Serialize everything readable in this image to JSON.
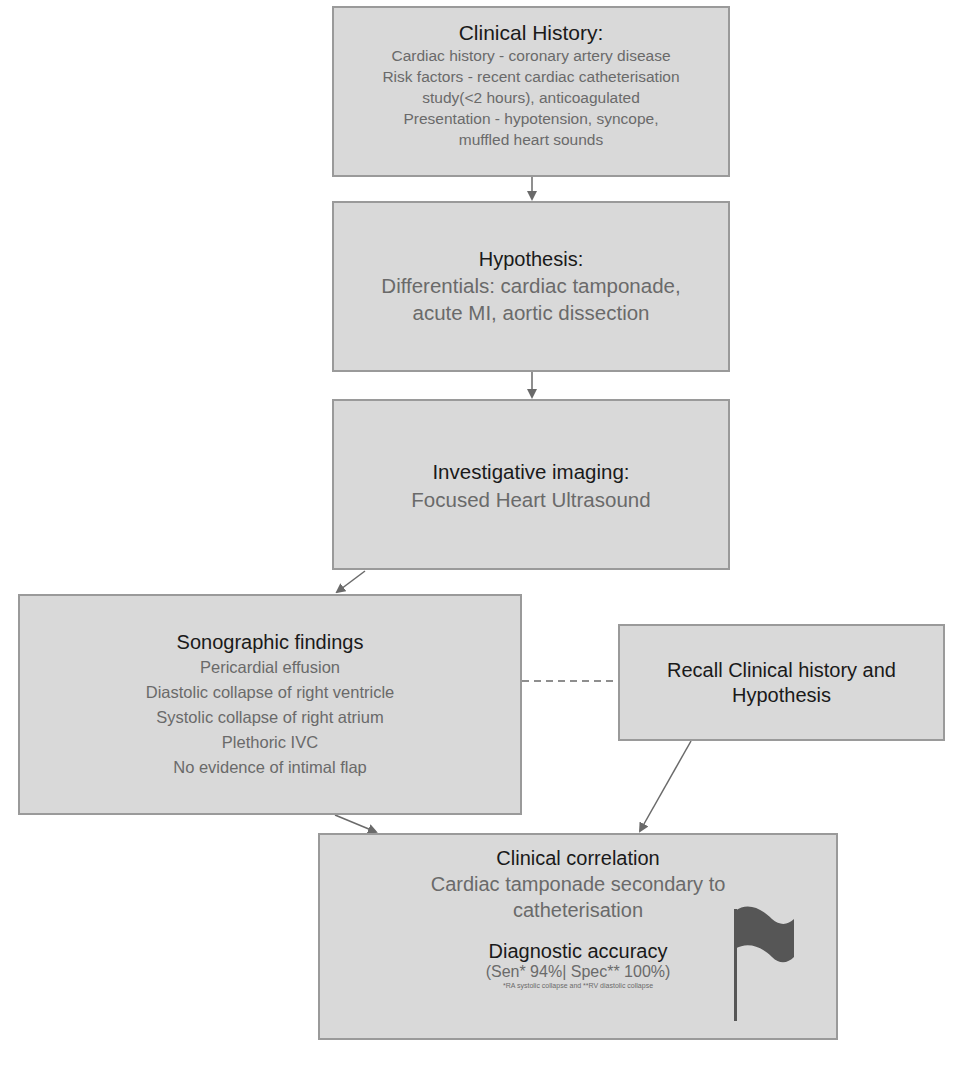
{
  "diagram": {
    "type": "clinical-reasoning-flowchart",
    "colors": {
      "background": "#ffffff",
      "box_fill": "#d9d9d9",
      "box_border": "#9a9a9a",
      "title_text": "#1a1a1a",
      "body_text": "#6a6a6a",
      "connector": "#6a6a6a",
      "flag": "#565656"
    },
    "nodes": {
      "clinical_history": {
        "title": "Clinical History:",
        "lines": [
          "Cardiac history - coronary artery disease",
          "Risk factors - recent cardiac catheterisation",
          "study(<2 hours), anticoagulated",
          "Presentation - hypotension, syncope,",
          "muffled heart sounds"
        ]
      },
      "hypothesis": {
        "title": "Hypothesis:",
        "lines": [
          "Differentials: cardiac tamponade,",
          "acute MI, aortic dissection"
        ]
      },
      "imaging": {
        "title": "Investigative imaging:",
        "lines": [
          "Focused Heart Ultrasound"
        ]
      },
      "sonographic": {
        "title": "Sonographic findings",
        "lines": [
          "Pericardial effusion",
          "Diastolic collapse of right ventricle",
          "Systolic collapse of right atrium",
          "Plethoric IVC",
          "No evidence of intimal flap"
        ]
      },
      "recall": {
        "title_lines": [
          "Recall Clinical history and",
          "Hypothesis"
        ]
      },
      "correlation": {
        "title": "Clinical correlation",
        "lines": [
          "Cardiac tamponade secondary to",
          "catheterisation"
        ],
        "accuracy_title": "Diagnostic accuracy",
        "accuracy_value": "(Sen* 94%| Spec** 100%)",
        "accuracy_note": "*RA systolic collapse and **RV diastolic collapse",
        "icon": "flag-icon"
      }
    },
    "edges": [
      {
        "from": "clinical_history",
        "to": "hypothesis",
        "style": "solid-arrow"
      },
      {
        "from": "hypothesis",
        "to": "imaging",
        "style": "solid-arrow"
      },
      {
        "from": "imaging",
        "to": "sonographic",
        "style": "solid-arrow"
      },
      {
        "from": "sonographic",
        "to": "recall",
        "style": "dashed"
      },
      {
        "from": "sonographic",
        "to": "correlation",
        "style": "solid-arrow"
      },
      {
        "from": "recall",
        "to": "correlation",
        "style": "solid-arrow"
      }
    ]
  }
}
